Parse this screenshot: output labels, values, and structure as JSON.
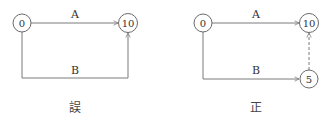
{
  "diagrams": [
    {
      "caption": "誤",
      "nodes": [
        {
          "id": "start",
          "label": "0"
        },
        {
          "id": "end",
          "label": "10"
        }
      ],
      "edges": [
        {
          "label": "A",
          "from": "0",
          "to": "10",
          "style": "solid"
        },
        {
          "label": "B",
          "from": "0",
          "to": "10",
          "style": "solid"
        }
      ]
    },
    {
      "caption": "正",
      "nodes": [
        {
          "id": "start",
          "label": "0"
        },
        {
          "id": "end",
          "label": "10"
        },
        {
          "id": "dummy",
          "label": "5"
        }
      ],
      "edges": [
        {
          "label": "A",
          "from": "0",
          "to": "10",
          "style": "solid"
        },
        {
          "label": "B",
          "from": "0",
          "to": "5",
          "style": "solid"
        },
        {
          "label": "",
          "from": "5",
          "to": "10",
          "style": "dashed"
        }
      ]
    }
  ],
  "colors": {
    "line": "#7a7a7a",
    "node_border": "#6a6a6a",
    "text": "#333333"
  }
}
